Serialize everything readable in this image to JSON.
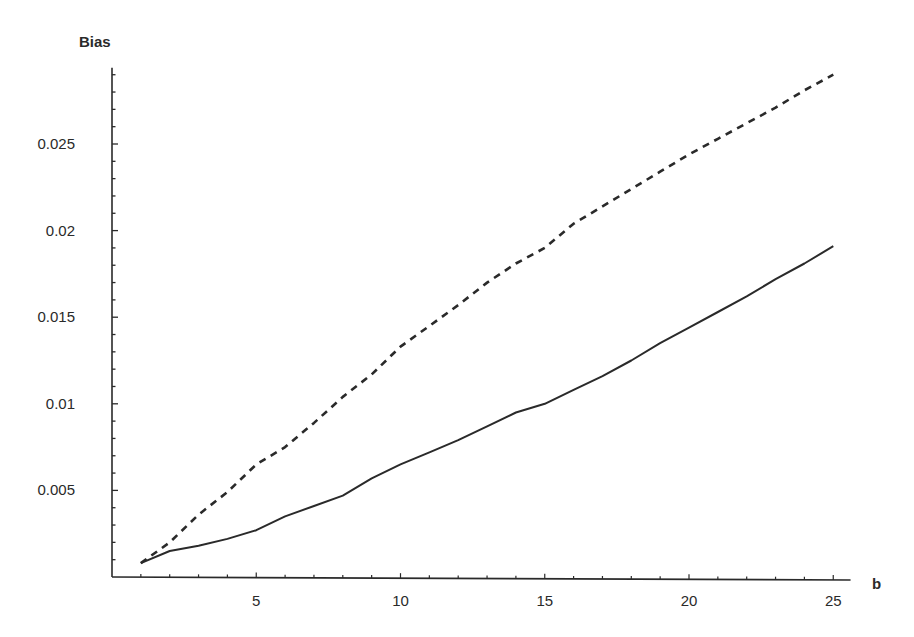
{
  "chart_data": {
    "type": "line",
    "title": "",
    "xlabel": "b",
    "ylabel": "Bias",
    "xlim": [
      0,
      25.6
    ],
    "ylim": [
      0,
      0.0294
    ],
    "grid": false,
    "legend": null,
    "x_ticks": [
      5,
      10,
      15,
      20,
      25
    ],
    "x_tick_labels": [
      "5",
      "10",
      "15",
      "20",
      "25"
    ],
    "y_ticks": [
      0.005,
      0.01,
      0.015,
      0.02,
      0.025
    ],
    "y_tick_labels": [
      "0.005",
      "0.01",
      "0.015",
      "0.02",
      "0.025"
    ],
    "x": [
      1,
      2,
      3,
      4,
      5,
      6,
      7,
      8,
      9,
      10,
      11,
      12,
      13,
      14,
      15,
      16,
      17,
      18,
      19,
      20,
      21,
      22,
      23,
      24,
      25
    ],
    "series": [
      {
        "name": "dashed",
        "style": "dashed",
        "color": "#2a2a2a",
        "values": [
          0.0008,
          0.002,
          0.0036,
          0.0049,
          0.0065,
          0.0075,
          0.0089,
          0.0104,
          0.0117,
          0.0133,
          0.0145,
          0.0157,
          0.017,
          0.0181,
          0.019,
          0.0204,
          0.0214,
          0.0224,
          0.0234,
          0.0244,
          0.0253,
          0.0262,
          0.0271,
          0.0281,
          0.029
        ]
      },
      {
        "name": "solid",
        "style": "solid",
        "color": "#2a2a2a",
        "values": [
          0.0008,
          0.0015,
          0.0018,
          0.0022,
          0.0027,
          0.0035,
          0.0041,
          0.0047,
          0.0057,
          0.0065,
          0.0072,
          0.0079,
          0.0087,
          0.0095,
          0.01,
          0.0108,
          0.0116,
          0.0125,
          0.0135,
          0.0144,
          0.0153,
          0.0162,
          0.0172,
          0.0181,
          0.0191
        ]
      }
    ]
  },
  "axes": {
    "x_label": "b",
    "y_label": "Bias"
  }
}
